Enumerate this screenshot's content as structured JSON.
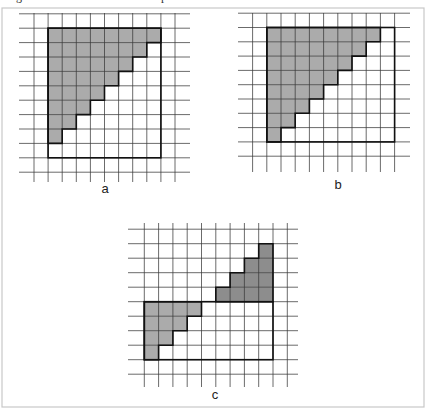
{
  "figure": {
    "caption_fragments": [
      {
        "text": "g",
        "x": 12
      },
      {
        "text": "p",
        "x": 157
      }
    ],
    "frame": {
      "x": 2,
      "y": 8,
      "width": 422,
      "height": 399,
      "color": "#c8c8c8"
    },
    "colors": {
      "light_shade": "#ababab",
      "dark_shade": "#8d8d8d",
      "grid_line": "#3a3a3a",
      "outline": "#111111"
    },
    "panels": [
      {
        "id": "a",
        "label": "a",
        "label_pos": {
          "x": 105,
          "y": 193
        },
        "grid": {
          "x_lines": [
            34,
            48.1,
            62.2,
            76.3,
            90.4,
            104.5,
            118.6,
            132.7,
            146.8,
            160.9,
            175
          ],
          "y_lines": [
            13.8,
            28.2,
            42.6,
            57,
            71.4,
            85.8,
            100.2,
            114.6,
            129,
            143.4,
            157.8,
            172.2
          ],
          "v_extent": [
            13,
            182
          ],
          "h_extent": [
            19,
            190
          ]
        },
        "rectangle": {
          "col_start": 1,
          "col_end": 9,
          "row_start": 1,
          "row_end": 10
        },
        "shaded": {
          "shade": "light",
          "description": "lower-left staircase: top row full width (8), decreasing by 1 per row, bottom row empty",
          "rows": [
            {
              "row": 1,
              "from_col": 1,
              "to_col": 9
            },
            {
              "row": 2,
              "from_col": 1,
              "to_col": 8
            },
            {
              "row": 3,
              "from_col": 1,
              "to_col": 7
            },
            {
              "row": 4,
              "from_col": 1,
              "to_col": 6
            },
            {
              "row": 5,
              "from_col": 1,
              "to_col": 5
            },
            {
              "row": 6,
              "from_col": 1,
              "to_col": 4
            },
            {
              "row": 7,
              "from_col": 1,
              "to_col": 3
            },
            {
              "row": 8,
              "from_col": 1,
              "to_col": 2
            }
          ]
        }
      },
      {
        "id": "b",
        "label": "b",
        "label_pos": {
          "x": 338,
          "y": 189
        },
        "grid": {
          "x_lines": [
            252.6,
            266.8,
            281,
            295.2,
            309.4,
            323.6,
            337.8,
            352,
            366.2,
            380.4,
            394.6
          ],
          "y_lines": [
            13.2,
            27.5,
            41.8,
            56.1,
            70.4,
            84.7,
            99,
            113.3,
            127.6,
            141.9,
            156.2
          ],
          "v_extent": [
            13,
            172
          ],
          "h_extent": [
            238,
            410
          ]
        },
        "rectangle": {
          "col_start": 1,
          "col_end": 10,
          "row_start": 1,
          "row_end": 9
        },
        "shaded": {
          "shade": "light",
          "description": "lower-left staircase: 8 rows, top row 8 of 9 columns, decreasing by 1",
          "rows": [
            {
              "row": 1,
              "from_col": 1,
              "to_col": 9
            },
            {
              "row": 2,
              "from_col": 1,
              "to_col": 8
            },
            {
              "row": 3,
              "from_col": 1,
              "to_col": 7
            },
            {
              "row": 4,
              "from_col": 1,
              "to_col": 6
            },
            {
              "row": 5,
              "from_col": 1,
              "to_col": 5
            },
            {
              "row": 6,
              "from_col": 1,
              "to_col": 4
            },
            {
              "row": 7,
              "from_col": 1,
              "to_col": 3
            },
            {
              "row": 8,
              "from_col": 1,
              "to_col": 2
            }
          ]
        }
      },
      {
        "id": "c",
        "label": "c",
        "label_pos": {
          "x": 215,
          "y": 399
        },
        "grid": {
          "x_lines": [
            144.3,
            158.6,
            172.9,
            187.2,
            201.5,
            215.8,
            230.1,
            244.4,
            258.7,
            273,
            287.3
          ],
          "y_lines": [
            229.2,
            243.7,
            258.2,
            272.7,
            287.2,
            301.7,
            316.2,
            330.7,
            345.2,
            359.7,
            374.2
          ],
          "v_extent": [
            223,
            387
          ],
          "h_extent": [
            128,
            298
          ]
        },
        "rectangle": {
          "col_start": 0,
          "col_end": 9,
          "row_start": 5,
          "row_end": 9
        },
        "shaded": {
          "shade": "light",
          "description": "lower-left staircase inside rectangle: 4,3,2,1 cells",
          "rows": [
            {
              "row": 5,
              "from_col": 0,
              "to_col": 4
            },
            {
              "row": 6,
              "from_col": 0,
              "to_col": 3
            },
            {
              "row": 7,
              "from_col": 0,
              "to_col": 2
            },
            {
              "row": 8,
              "from_col": 0,
              "to_col": 1
            }
          ]
        },
        "shaded_extra": {
          "shade": "dark",
          "description": "staircase above rectangle, right-aligned: 1,2,3,4 cells",
          "rows": [
            {
              "row": 1,
              "from_col": 8,
              "to_col": 9
            },
            {
              "row": 2,
              "from_col": 7,
              "to_col": 9
            },
            {
              "row": 3,
              "from_col": 6,
              "to_col": 9
            },
            {
              "row": 4,
              "from_col": 5,
              "to_col": 9
            }
          ]
        }
      }
    ]
  }
}
